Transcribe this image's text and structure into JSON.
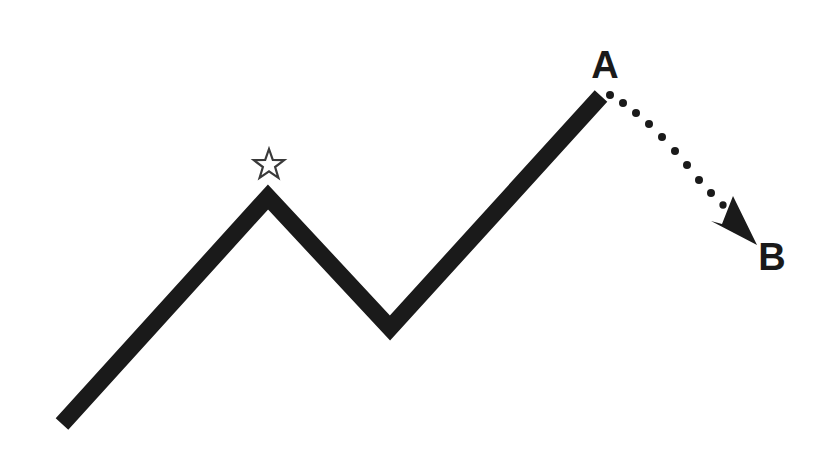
{
  "figure": {
    "background_color": "#ffffff",
    "stroke_color": "#1a1a1a",
    "width": 835,
    "height": 460
  },
  "labels": {
    "point_a": "A",
    "point_b": "B"
  },
  "annotations": {
    "star_marker": "star-outline",
    "arrow_marker": "arrowhead",
    "dotted_connector": "dotted-projection-line"
  },
  "chart_data": {
    "type": "line",
    "title": "",
    "xlabel": "",
    "ylabel": "",
    "grid": false,
    "legend": "none",
    "xlim": [
      0,
      835
    ],
    "ylim": [
      460,
      0
    ],
    "series": [
      {
        "name": "solid-zigzag-trend",
        "style": "solid",
        "stroke_width": 17,
        "points": [
          [
            62,
            424
          ],
          [
            268,
            197
          ],
          [
            390,
            328
          ],
          [
            601,
            96
          ]
        ]
      },
      {
        "name": "dotted-projection",
        "style": "dotted",
        "dot_count": 11,
        "dot_diameter": 8,
        "points": [
          [
            610,
            95
          ],
          [
            623,
            103
          ],
          [
            636,
            113
          ],
          [
            649,
            124
          ],
          [
            662,
            137
          ],
          [
            675,
            151
          ],
          [
            687,
            165
          ],
          [
            699,
            180
          ],
          [
            711,
            193
          ],
          [
            723,
            205
          ],
          [
            734,
            215
          ]
        ]
      }
    ],
    "markers": [
      {
        "name": "star",
        "shape": "star-outline",
        "filled": false,
        "x": 269,
        "y": 165,
        "size": 32
      },
      {
        "name": "arrowhead",
        "shape": "swept-arrow",
        "filled": true,
        "tip_x": 757,
        "tip_y": 245,
        "direction": "down-right"
      }
    ],
    "annotations": [
      {
        "text": "A",
        "x": 605,
        "y": 65,
        "bold": true
      },
      {
        "text": "B",
        "x": 770,
        "y": 256,
        "bold": true
      }
    ]
  }
}
